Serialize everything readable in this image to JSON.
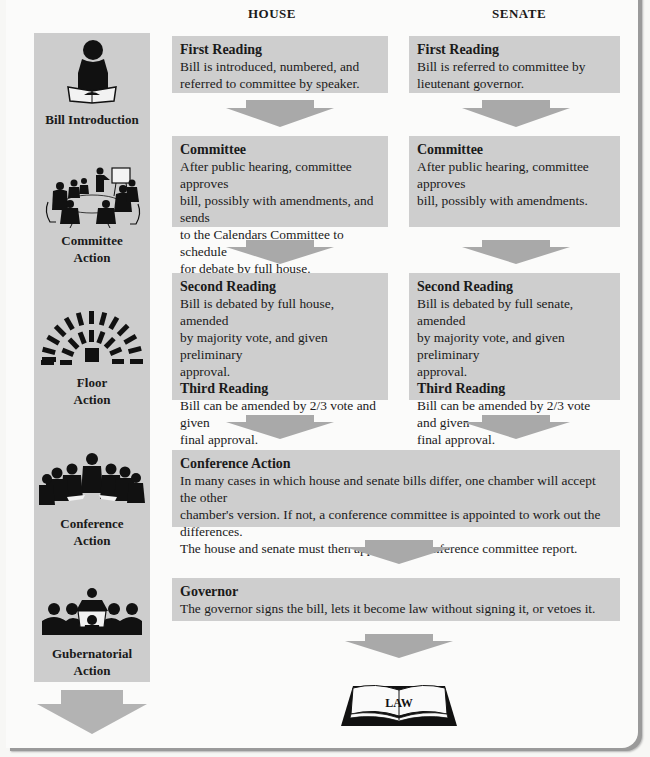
{
  "columns": {
    "house": "HOUSE",
    "senate": "SENATE"
  },
  "stages": [
    {
      "id": "bill-introduction",
      "label_lines": [
        "Bill Introduction"
      ],
      "icon": "reader-silhouette-icon"
    },
    {
      "id": "committee-action",
      "label_lines": [
        "Committee",
        "Action"
      ],
      "icon": "committee-meeting-icon"
    },
    {
      "id": "floor-action",
      "label_lines": [
        "Floor",
        "Action"
      ],
      "icon": "chamber-seating-icon"
    },
    {
      "id": "conference-action",
      "label_lines": [
        "Conference",
        "Action"
      ],
      "icon": "conference-group-icon"
    },
    {
      "id": "gubernatorial-action",
      "label_lines": [
        "Gubernatorial",
        "Action"
      ],
      "icon": "governor-podium-icon"
    }
  ],
  "house": {
    "first_reading": {
      "title": "First Reading",
      "lines": [
        "Bill is introduced, numbered, and",
        "referred to committee by speaker."
      ]
    },
    "committee": {
      "title": "Committee",
      "lines": [
        "After public hearing, committee approves",
        "bill, possibly with amendments, and sends",
        "to the Calendars Committee to schedule",
        "for debate by  full house."
      ]
    },
    "second_reading": {
      "title": "Second Reading",
      "lines": [
        "Bill is debated by full house, amended",
        "by  majority vote, and given preliminary",
        "approval."
      ]
    },
    "third_reading": {
      "title": "Third Reading",
      "lines": [
        "Bill can be amended by 2/3 vote and given",
        "final approval."
      ]
    }
  },
  "senate": {
    "first_reading": {
      "title": "First Reading",
      "lines": [
        "Bill is referred to committee by",
        "lieutenant governor."
      ]
    },
    "committee": {
      "title": "Committee",
      "lines": [
        "After public hearing, committee approves",
        "bill, possibly with amendments."
      ]
    },
    "second_reading": {
      "title": "Second Reading",
      "lines": [
        "Bill is debated by full senate, amended",
        "by  majority vote, and given preliminary",
        "approval."
      ]
    },
    "third_reading": {
      "title": "Third Reading",
      "lines": [
        "Bill can be amended by 2/3 vote and given",
        "final approval."
      ]
    }
  },
  "conference": {
    "title": "Conference Action",
    "lines": [
      "In many cases in which house and senate bills differ, one chamber will accept the other",
      "chamber's version.  If not, a conference committee is appointed to work out the differences.",
      "The house and senate must then approve the conference committee report."
    ]
  },
  "governor": {
    "title": "Governor",
    "lines": [
      "The governor signs the bill, lets it become law without signing it, or vetoes it."
    ]
  },
  "result": {
    "label": "LAW",
    "icon": "open-book-icon"
  },
  "colors": {
    "box": "#cecece",
    "arrow": "#a9a9a9",
    "stage_column": "#cdcdcd",
    "icon": "#111111"
  }
}
